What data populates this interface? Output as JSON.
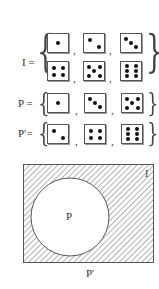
{
  "sets": [
    {
      "label": "I =",
      "rows": [
        [
          1,
          2,
          3
        ],
        [
          4,
          5,
          6
        ]
      ]
    },
    {
      "label": "P =",
      "rows": [
        [
          1,
          3,
          5
        ]
      ]
    },
    {
      "label": "P′=",
      "rows": [
        [
          2,
          4,
          6
        ]
      ]
    }
  ],
  "venn": {
    "universe_label": "I",
    "circle_label": "P",
    "complement_label": "P′",
    "shaded_region": "complement of P"
  },
  "colors": {
    "line": "#555555",
    "hatch": "#666666",
    "pip": "#111111"
  }
}
